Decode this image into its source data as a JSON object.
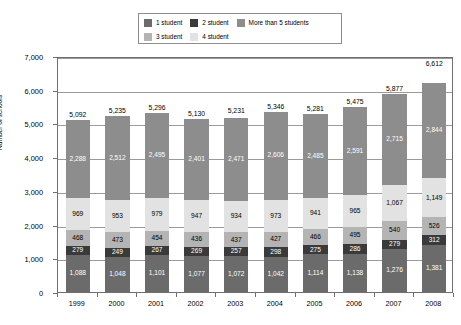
{
  "chart_data": {
    "type": "bar",
    "subtype": "stacked-vertical",
    "title": "",
    "xlabel": "",
    "ylabel": "Number of schools",
    "ylim": [
      0,
      7000
    ],
    "ytick_values": [
      0,
      1000,
      2000,
      3000,
      4000,
      5000,
      6000,
      7000
    ],
    "ytick_labels": [
      "0",
      "1,000",
      "2,000",
      "3,000",
      "4,000",
      "5,000",
      "6,000",
      "7,000"
    ],
    "grid": true,
    "legend_position": "top-center",
    "categories": [
      "1999",
      "2000",
      "2001",
      "2002",
      "2003",
      "2004",
      "2005",
      "2006",
      "2007",
      "2008"
    ],
    "series": [
      {
        "name": "1 student",
        "color": "#6b6b6b",
        "label_color": "#ffffff",
        "values": [
          1088,
          1048,
          1101,
          1077,
          1072,
          1042,
          1114,
          1138,
          1276,
          1381
        ],
        "value_labels": [
          "1,088",
          "1,048",
          "1,101",
          "1,077",
          "1,072",
          "1,042",
          "1,114",
          "1,138",
          "1,276",
          "1,381"
        ]
      },
      {
        "name": "2 student",
        "color": "#3a3a3a",
        "label_color": "#ffffff",
        "values": [
          279,
          249,
          267,
          269,
          257,
          298,
          275,
          286,
          279,
          312
        ],
        "value_labels": [
          "279",
          "249",
          "267",
          "269",
          "257",
          "298",
          "275",
          "286",
          "279",
          "312"
        ]
      },
      {
        "name": "3 student",
        "color": "#b4b4b4",
        "label_color": "#000000",
        "values": [
          468,
          473,
          454,
          436,
          437,
          427,
          466,
          495,
          540,
          526
        ],
        "value_labels": [
          "468",
          "473",
          "454",
          "436",
          "437",
          "427",
          "466",
          "495",
          "540",
          "526"
        ]
      },
      {
        "name": "4 student",
        "color": "#e2e2e2",
        "label_color": "#000000",
        "values": [
          969,
          953,
          979,
          947,
          934,
          973,
          941,
          965,
          1067,
          1149
        ],
        "value_labels": [
          "969",
          "953",
          "979",
          "947",
          "934",
          "973",
          "941",
          "965",
          "1,067",
          "1,149"
        ]
      },
      {
        "name": "More than 5 students",
        "color": "#8d8d8d",
        "label_color": "#ffffff",
        "values": [
          2288,
          2512,
          2495,
          2401,
          2471,
          2606,
          2485,
          2591,
          2715,
          2844
        ],
        "value_labels": [
          "2,288",
          "2,512",
          "2,495",
          "2,401",
          "2,471",
          "2,606",
          "2,485",
          "2,591",
          "2,715",
          "2,844"
        ]
      }
    ],
    "totals": [
      5092,
      5235,
      5296,
      5130,
      5231,
      5346,
      5281,
      5475,
      5877,
      6612
    ],
    "total_labels": [
      "5,092",
      "5,235",
      "5,296",
      "5,130",
      "5,231",
      "5,346",
      "5,281",
      "5,475",
      "5,877",
      "6,612"
    ]
  },
  "legend": {
    "rows": [
      [
        {
          "label": "1 student",
          "color": "#6b6b6b"
        },
        {
          "label": "2 student",
          "color": "#3a3a3a"
        },
        {
          "label": "More than 5 students",
          "color": "#8d8d8d"
        }
      ],
      [
        {
          "label": "3 student",
          "color": "#b4b4b4"
        },
        {
          "label": "4 student",
          "color": "#e2e2e2"
        }
      ]
    ]
  },
  "style": {
    "frame_color": "#6f6f6f",
    "grid_color": "#9a9a9a",
    "background": "#ffffff"
  }
}
